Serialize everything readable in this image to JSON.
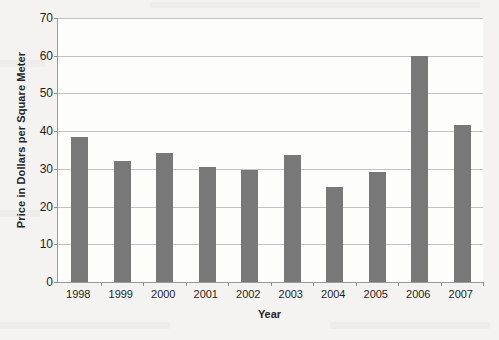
{
  "chart_data": {
    "type": "bar",
    "title": "",
    "xlabel": "Year",
    "ylabel": "Price in Dollars per Square Meter",
    "categories": [
      "1998",
      "1999",
      "2000",
      "2001",
      "2002",
      "2003",
      "2004",
      "2005",
      "2006",
      "2007"
    ],
    "values": [
      38.5,
      32.0,
      34.3,
      30.4,
      29.7,
      33.7,
      25.1,
      29.1,
      60.0,
      41.7
    ],
    "ylim": [
      0,
      70
    ],
    "ytick_labels": [
      "0",
      "10",
      "20",
      "30",
      "40",
      "50",
      "60",
      "70"
    ],
    "ytick_values": [
      0,
      10,
      20,
      30,
      40,
      50,
      60,
      70
    ],
    "grid": "horizontal",
    "legend": "none",
    "bar_color": "#787878",
    "gridline_color": "#c2c2c2",
    "axis_color": "#9a9a9a",
    "plot_background": "#fdfdfc",
    "page_background": "#f4f3f1"
  }
}
